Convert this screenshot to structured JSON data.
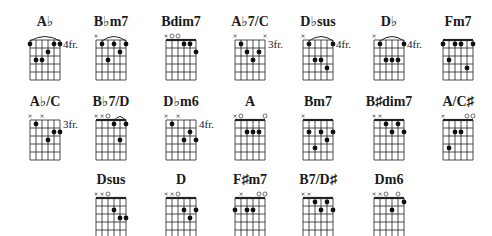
{
  "sheet": {
    "title": "Chord diagrams",
    "rows": [
      {
        "y": 14,
        "chords": [
          {
            "name": "A♭",
            "x": 14,
            "fret": "4fr.",
            "barre": {
              "from": 0,
              "to": 5,
              "fret": 1
            },
            "muted": [],
            "open": [],
            "dots": [
              [
                0,
                1
              ],
              [
                1,
                3
              ],
              [
                2,
                3
              ],
              [
                3,
                2
              ],
              [
                4,
                1
              ],
              [
                5,
                1
              ]
            ]
          },
          {
            "name": "B♭m7",
            "x": 80,
            "fret": "",
            "barre": {
              "from": 1,
              "to": 5,
              "fret": 1
            },
            "muted": [
              0
            ],
            "open": [],
            "dots": [
              [
                1,
                1
              ],
              [
                2,
                3
              ],
              [
                3,
                1
              ],
              [
                4,
                2
              ],
              [
                5,
                1
              ]
            ]
          },
          {
            "name": "Bdim7",
            "x": 150,
            "fret": "",
            "barre": null,
            "nut": true,
            "muted": [
              0
            ],
            "open": [
              1,
              2
            ],
            "dots": [
              [
                3,
                1
              ],
              [
                4,
                1
              ],
              [
                5,
                2
              ]
            ],
            "extra": [
              [
                1,
                2
              ]
            ]
          },
          {
            "name": "A♭7/C",
            "x": 219,
            "fret": "3fr.",
            "barre": null,
            "muted": [
              0,
              5
            ],
            "open": [],
            "dots": [
              [
                1,
                1
              ],
              [
                2,
                2
              ],
              [
                3,
                3
              ],
              [
                4,
                2
              ]
            ]
          },
          {
            "name": "D♭sus",
            "x": 287,
            "fret": "4fr.",
            "barre": {
              "from": 1,
              "to": 5,
              "fret": 1
            },
            "muted": [
              0
            ],
            "open": [],
            "dots": [
              [
                1,
                1
              ],
              [
                2,
                3
              ],
              [
                3,
                3
              ],
              [
                4,
                4
              ],
              [
                5,
                1
              ]
            ]
          },
          {
            "name": "D♭",
            "x": 358,
            "fret": "4fr.",
            "barre": {
              "from": 1,
              "to": 5,
              "fret": 1
            },
            "muted": [
              0
            ],
            "open": [],
            "dots": [
              [
                1,
                1
              ],
              [
                2,
                3
              ],
              [
                3,
                3
              ],
              [
                4,
                3
              ],
              [
                5,
                1
              ]
            ]
          },
          {
            "name": "Fm7",
            "x": 427,
            "fret": "",
            "barre": null,
            "nut": true,
            "muted": [],
            "open": [],
            "dots": [
              [
                0,
                1
              ],
              [
                1,
                3
              ],
              [
                2,
                1
              ],
              [
                3,
                1
              ],
              [
                4,
                4
              ],
              [
                5,
                1
              ]
            ]
          }
        ]
      },
      {
        "y": 94,
        "chords": [
          {
            "name": "A♭/C",
            "x": 14,
            "fret": "3fr.",
            "barre": null,
            "muted": [
              0,
              2
            ],
            "open": [],
            "dots": [
              [
                1,
                1
              ],
              [
                3,
                3
              ],
              [
                4,
                2
              ],
              [
                5,
                2
              ]
            ]
          },
          {
            "name": "B♭7/D",
            "x": 80,
            "fret": "",
            "barre": {
              "from": 3,
              "to": 5,
              "fret": 1
            },
            "nut": true,
            "muted": [
              0,
              1
            ],
            "open": [
              2
            ],
            "dots": [
              [
                3,
                1
              ],
              [
                4,
                3
              ],
              [
                5,
                1
              ]
            ]
          },
          {
            "name": "D♭m6",
            "x": 150,
            "fret": "4fr.",
            "barre": null,
            "muted": [
              0,
              2
            ],
            "open": [],
            "dots": [
              [
                1,
                1
              ],
              [
                3,
                3
              ],
              [
                4,
                2
              ],
              [
                5,
                3
              ]
            ]
          },
          {
            "name": "A",
            "x": 219,
            "fret": "",
            "barre": null,
            "nut": true,
            "muted": [
              0
            ],
            "open": [
              1,
              5
            ],
            "dots": [
              [
                2,
                2
              ],
              [
                3,
                2
              ],
              [
                4,
                2
              ]
            ]
          },
          {
            "name": "Bm7",
            "x": 287,
            "fret": "",
            "barre": null,
            "nut": true,
            "muted": [
              0
            ],
            "open": [],
            "dots": [
              [
                1,
                2
              ],
              [
                2,
                4
              ],
              [
                3,
                2
              ],
              [
                4,
                3
              ],
              [
                5,
                2
              ]
            ]
          },
          {
            "name": "B♯dim7",
            "x": 358,
            "fret": "",
            "barre": null,
            "nut": true,
            "muted": [
              0,
              1
            ],
            "open": [],
            "dots": [
              [
                2,
                1
              ],
              [
                3,
                2
              ],
              [
                4,
                1
              ],
              [
                5,
                2
              ]
            ]
          },
          {
            "name": "A/C♯",
            "x": 427,
            "fret": "",
            "barre": null,
            "nut": true,
            "muted": [
              0
            ],
            "open": [
              4,
              5
            ],
            "dots": [
              [
                1,
                4
              ],
              [
                2,
                2
              ],
              [
                3,
                2
              ]
            ]
          }
        ]
      },
      {
        "y": 172,
        "chords": [
          {
            "name": "Dsus",
            "x": 80,
            "fret": "",
            "barre": null,
            "nut": true,
            "muted": [
              0,
              1
            ],
            "open": [
              2
            ],
            "dots": [
              [
                3,
                2
              ],
              [
                4,
                3
              ],
              [
                5,
                3
              ]
            ]
          },
          {
            "name": "D",
            "x": 150,
            "fret": "",
            "barre": null,
            "nut": true,
            "muted": [
              0,
              1
            ],
            "open": [
              2
            ],
            "dots": [
              [
                3,
                2
              ],
              [
                4,
                3
              ],
              [
                5,
                2
              ]
            ]
          },
          {
            "name": "F♯m7",
            "x": 219,
            "fret": "",
            "barre": null,
            "nut": true,
            "muted": [
              1
            ],
            "open": [
              4,
              5
            ],
            "dots": [
              [
                0,
                2
              ],
              [
                2,
                2
              ],
              [
                3,
                2
              ]
            ]
          },
          {
            "name": "B7/D♯",
            "x": 287,
            "fret": "",
            "barre": null,
            "nut": true,
            "muted": [
              0,
              1
            ],
            "open": [],
            "dots": [
              [
                2,
                1
              ],
              [
                3,
                2
              ],
              [
                4,
                1
              ],
              [
                5,
                2
              ]
            ]
          },
          {
            "name": "Dm6",
            "x": 358,
            "fret": "",
            "barre": null,
            "nut": true,
            "muted": [
              0,
              1
            ],
            "open": [
              2,
              4
            ],
            "dots": [
              [
                3,
                2
              ],
              [
                5,
                1
              ]
            ]
          }
        ]
      }
    ]
  }
}
